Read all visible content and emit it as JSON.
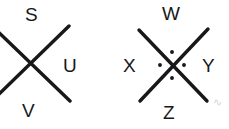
{
  "diagram": {
    "background_color": "#ffffff",
    "stroke_color": "#17181a",
    "width": 229,
    "height": 129,
    "figures": [
      {
        "id": "left-figure",
        "name": "left-x-figure",
        "description": "X shape formed by two crossed strokes, clipped at the left image edge",
        "center": {
          "x": 30,
          "y": 62
        },
        "strokes": [
          {
            "name": "stroke-down-right",
            "x1": -8,
            "y1": 26,
            "x2": 70,
            "y2": 101
          },
          {
            "name": "stroke-up-right",
            "x1": -6,
            "y1": 99,
            "x2": 69,
            "y2": 26
          }
        ],
        "dots": [],
        "labels": [
          {
            "name": "label-s",
            "text": "S",
            "x": 25,
            "y": 5
          },
          {
            "name": "label-u",
            "text": "U",
            "x": 63,
            "y": 56
          },
          {
            "name": "label-v",
            "text": "V",
            "x": 22,
            "y": 101
          }
        ]
      },
      {
        "id": "right-figure",
        "name": "right-x-figure",
        "description": "X shape with four dots arranged around the crossing point",
        "center": {
          "x": 172,
          "y": 65
        },
        "strokes": [
          {
            "name": "stroke-down-right",
            "x1": 139,
            "y1": 30,
            "x2": 207,
            "y2": 101
          },
          {
            "name": "stroke-up-right",
            "x1": 140,
            "y1": 101,
            "x2": 208,
            "y2": 29
          }
        ],
        "dots": [
          {
            "name": "dot-top",
            "x": 172,
            "y": 52,
            "r": 2.6
          },
          {
            "name": "dot-left",
            "x": 160,
            "y": 65,
            "r": 2.6
          },
          {
            "name": "dot-right",
            "x": 184,
            "y": 65,
            "r": 2.6
          },
          {
            "name": "dot-bottom",
            "x": 172,
            "y": 78,
            "r": 2.6
          }
        ],
        "labels": [
          {
            "name": "label-w",
            "text": "W",
            "x": 162,
            "y": 4
          },
          {
            "name": "label-x",
            "text": "X",
            "x": 123,
            "y": 56
          },
          {
            "name": "label-y",
            "text": "Y",
            "x": 202,
            "y": 56
          },
          {
            "name": "label-z",
            "text": "Z",
            "x": 163,
            "y": 103
          }
        ]
      }
    ],
    "watermark": {
      "name": "corner-watermark",
      "text": "∿",
      "x": 213,
      "y": 96
    }
  }
}
